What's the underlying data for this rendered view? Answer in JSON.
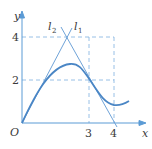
{
  "diagram": {
    "axes": {
      "x_label": "x",
      "y_label": "y",
      "origin_label": "O",
      "x_ticks": [
        "3",
        "4"
      ],
      "y_ticks": [
        "2",
        "4"
      ]
    },
    "lines": [
      {
        "name": "l2",
        "label": "l",
        "subscript": "2"
      },
      {
        "name": "l1",
        "label": "l",
        "subscript": "1"
      }
    ],
    "colors": {
      "axis": "#5b9bd5",
      "curve": "#4a86c5",
      "line": "#6fa3d8",
      "dashed": "#7fb0e0",
      "text": "#3a3a3a"
    }
  }
}
